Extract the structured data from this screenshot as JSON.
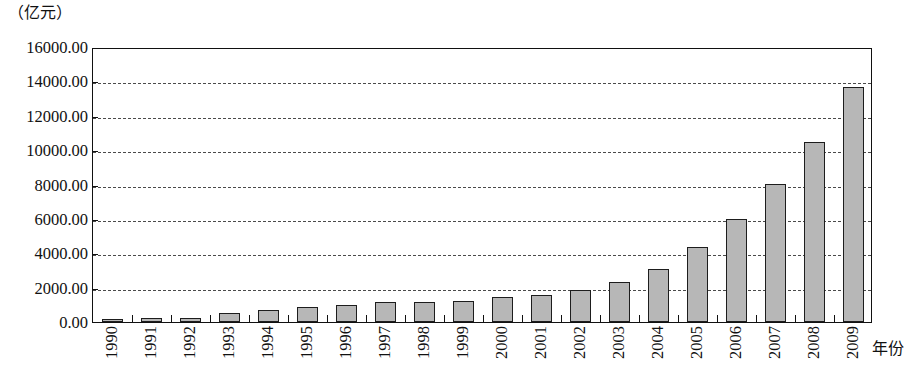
{
  "chart_data": {
    "type": "bar",
    "title": "",
    "unit_caption": "（亿元）",
    "xlabel": "年份",
    "ylabel": "",
    "ylim": [
      0,
      16000
    ],
    "ytick_step": 2000,
    "grid": true,
    "legend": null,
    "bar_color": "#b7b7b7",
    "bar_edge_color": "#1d1d1d",
    "ytick_labels": [
      "0.00",
      "2000.00",
      "4000.00",
      "6000.00",
      "8000.00",
      "10000.00",
      "12000.00",
      "14000.00",
      "16000.00"
    ],
    "ytick_values": [
      0,
      2000,
      4000,
      6000,
      8000,
      10000,
      12000,
      14000,
      16000
    ],
    "categories": [
      "1990",
      "1991",
      "1992",
      "1993",
      "1994",
      "1995",
      "1996",
      "1997",
      "1998",
      "1999",
      "2000",
      "2001",
      "2002",
      "2003",
      "2004",
      "2005",
      "2006",
      "2007",
      "2008",
      "2009"
    ],
    "values": [
      200,
      210,
      230,
      500,
      700,
      850,
      1000,
      1150,
      1150,
      1200,
      1450,
      1600,
      1850,
      2350,
      3100,
      4350,
      6000,
      8050,
      10500,
      13700
    ]
  }
}
